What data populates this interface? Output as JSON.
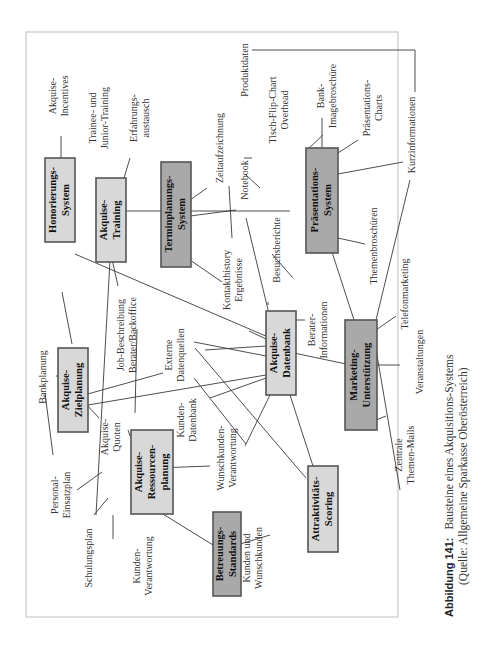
{
  "figure": {
    "orientation": "rotated 90deg counterclockwise",
    "caption_label": "Abbildung 141:",
    "caption_title": "Bausteine eines Akquisitions-Systems",
    "caption_source": "(Quelle: Allgemeine Sparkasse Oberösterreich)"
  },
  "colors": {
    "box_light": "#d8d8d8",
    "box_dark": "#a9a9a9",
    "border": "#555555",
    "line": "#3a3a3a"
  },
  "boxes": {
    "honorierung": {
      "l1": "Honorierungs-",
      "l2": "System",
      "shade": "light"
    },
    "training": {
      "l1": "Akquise-",
      "l2": "Training",
      "shade": "light"
    },
    "termin": {
      "l1": "Terminplanungs-",
      "l2": "System",
      "shade": "dark"
    },
    "praesentation": {
      "l1": "Präsentations-",
      "l2": "System",
      "shade": "dark"
    },
    "ziel": {
      "l1": "Akquise-",
      "l2": "Zielplanung",
      "shade": "light"
    },
    "datenbank": {
      "l1": "Akquise-",
      "l2": "Datenbank",
      "shade": "light"
    },
    "marketing": {
      "l1": "Marketing-",
      "l2": "Unterstützung",
      "shade": "dark"
    },
    "ressourcen": {
      "l1": "Akquise-",
      "l2": "Ressourcen-",
      "l3": "planung",
      "shade": "light"
    },
    "betreuung": {
      "l1": "Betreuungs-",
      "l2": "Standards",
      "shade": "dark"
    },
    "scoring": {
      "l1": "Attraktivitäts-",
      "l2": "Scoring",
      "shade": "light"
    }
  },
  "labels": {
    "incentives": {
      "l1": "Akquise-",
      "l2": "Incentives"
    },
    "trainee": {
      "l1": "Trainee- und",
      "l2": "Junior-Training"
    },
    "erfahrung": {
      "l1": "Erfahrungs-",
      "l2": "austausch"
    },
    "zeit": {
      "l1": "Zeitaufzeichnung"
    },
    "notebook": {
      "l1": "Notebook"
    },
    "produkt": {
      "l1": "Produktdaten"
    },
    "flipchart": {
      "l1": "Tisch-Flip-Chart",
      "l2": "Overhead"
    },
    "imagebroschuere": {
      "l1": "Bank-",
      "l2": "Imagebroschüre"
    },
    "charts": {
      "l1": "Präsentations-",
      "l2": "Charts"
    },
    "kurzinfo": {
      "l1": "Kurzinformationen"
    },
    "kontakthistory": {
      "l1": "Kontakthistory",
      "l2": "Ergebnisse"
    },
    "besuch": {
      "l1": "Besuchsberichte"
    },
    "themenbroschueren": {
      "l1": "Themenbroschüren"
    },
    "jobbeschreibung": {
      "l1": "Job-Beschreibung",
      "l2": "Berater/Backoffice"
    },
    "externe": {
      "l1": "Externe",
      "l2": "Datenquellen"
    },
    "beraterinfo": {
      "l1": "Berater-",
      "l2": "Informationen"
    },
    "telefon": {
      "l1": "Telefonmarketing"
    },
    "veranstaltungen": {
      "l1": "Veranstaltungen"
    },
    "bankplanung": {
      "l1": "Bankplanung"
    },
    "quoten": {
      "l1": "Akquise-",
      "l2": "Quoten"
    },
    "kundendb": {
      "l1": "Kunden-",
      "l2": "Datenbank"
    },
    "personal": {
      "l1": "Personal-",
      "l2": "Einsatzplan"
    },
    "wunsch": {
      "l1": "Wunschkunden-",
      "l2": "Verantwortung"
    },
    "schulung": {
      "l1": "Schulungsplan"
    },
    "kundenverantw": {
      "l1": "Kunden-",
      "l2": "Verantwortung"
    },
    "kundenwunsch": {
      "l1": "Kunden und",
      "l2": "Wunschkunden"
    },
    "themenmails": {
      "l1": "Zentrale",
      "l2": "Themen-Mails"
    }
  }
}
